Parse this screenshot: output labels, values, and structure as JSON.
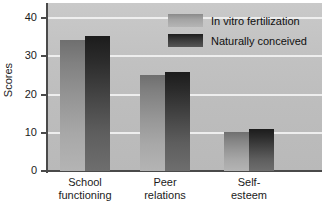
{
  "chart_data": {
    "type": "bar",
    "title": "",
    "xlabel": "",
    "ylabel": "Scores",
    "categories": [
      "School functioning",
      "Peer relations",
      "Self-esteem"
    ],
    "category_lines": [
      [
        "School",
        "functioning"
      ],
      [
        "Peer",
        "relations"
      ],
      [
        "Self-",
        "esteem"
      ]
    ],
    "series": [
      {
        "name": "In vitro fertilization",
        "values": [
          34.3,
          25.2,
          10.3
        ],
        "color": "#a3a3a3"
      },
      {
        "name": "Naturally conceived",
        "values": [
          35.4,
          26.0,
          11.0
        ],
        "color": "#2f2f2f"
      }
    ],
    "ylim": [
      0,
      44
    ],
    "yticks": [
      0,
      10,
      20,
      30,
      40
    ],
    "ytick_labels": [
      "0",
      "10",
      "20",
      "30",
      "40"
    ],
    "grid": true,
    "grid_axis": "y",
    "legend_position": "top-right",
    "plot_background": "#c2c2c2"
  }
}
